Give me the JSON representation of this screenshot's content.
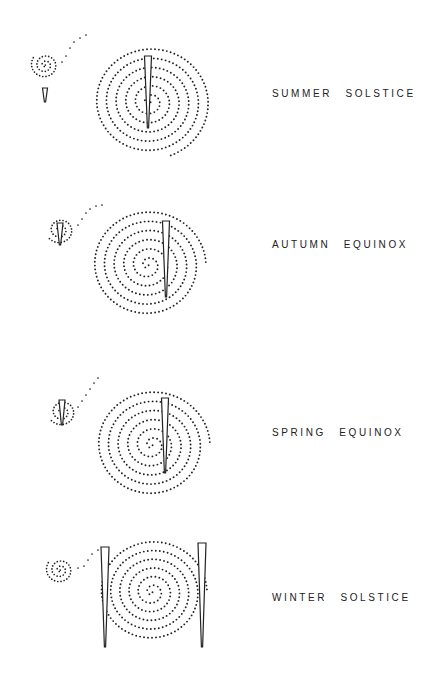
{
  "panels": [
    {
      "label": "SUMMER SOLSTICE",
      "top": 20,
      "label_y": 68,
      "small": {
        "cx": 45,
        "cy": 45,
        "turns": 2.6,
        "rmax": 14
      },
      "tail": [
        [
          62,
          42
        ],
        [
          66,
          36
        ],
        [
          70,
          28
        ],
        [
          74,
          22
        ],
        [
          80,
          18
        ],
        [
          86,
          15
        ]
      ],
      "big": {
        "cx": 150,
        "cy": 82,
        "turns": 6.2,
        "rmax": 60
      },
      "daggers": [
        {
          "x": 148,
          "top": 36,
          "bottom": 108,
          "w": 7
        },
        {
          "x": 45,
          "top": 68,
          "bottom": 82,
          "w": 5
        }
      ]
    },
    {
      "label": "AUTUMN EQUINOX",
      "top": 185,
      "label_y": 54,
      "small": {
        "cx": 60,
        "cy": 45,
        "turns": 2.4,
        "rmax": 14
      },
      "tail": [
        [
          78,
          40
        ],
        [
          82,
          34
        ],
        [
          86,
          28
        ],
        [
          90,
          24
        ],
        [
          96,
          21
        ],
        [
          102,
          20
        ]
      ],
      "big": {
        "cx": 148,
        "cy": 80,
        "turns": 6.0,
        "rmax": 58
      },
      "daggers": [
        {
          "x": 166,
          "top": 36,
          "bottom": 112,
          "w": 7
        },
        {
          "x": 60,
          "top": 38,
          "bottom": 60,
          "w": 6
        }
      ]
    },
    {
      "label": "SPRING EQUINOX",
      "top": 355,
      "label_y": 72,
      "small": {
        "cx": 62,
        "cy": 57,
        "turns": 2.4,
        "rmax": 14
      },
      "tail": [
        [
          78,
          52
        ],
        [
          82,
          46
        ],
        [
          86,
          40
        ],
        [
          90,
          34
        ],
        [
          94,
          28
        ],
        [
          98,
          23
        ]
      ],
      "big": {
        "cx": 152,
        "cy": 90,
        "turns": 6.0,
        "rmax": 58
      },
      "daggers": [
        {
          "x": 165,
          "top": 43,
          "bottom": 118,
          "w": 7
        },
        {
          "x": 62,
          "top": 45,
          "bottom": 70,
          "w": 6
        }
      ]
    },
    {
      "label": "WINTER SOLSTICE",
      "top": 520,
      "label_y": 72,
      "small": {
        "cx": 60,
        "cy": 50,
        "turns": 2.6,
        "rmax": 14
      },
      "tail": [
        [
          78,
          48
        ],
        [
          84,
          46
        ],
        [
          88,
          40
        ],
        [
          92,
          34
        ],
        [
          98,
          30
        ],
        [
          104,
          28
        ]
      ],
      "big": {
        "cx": 152,
        "cy": 72,
        "turns": 6.0,
        "rmax": 55
      },
      "daggers": [
        {
          "x": 105,
          "top": 27,
          "bottom": 127,
          "w": 8
        },
        {
          "x": 202,
          "top": 23,
          "bottom": 127,
          "w": 8
        }
      ]
    }
  ],
  "colors": {
    "ink": "#222222",
    "background": "#ffffff"
  }
}
